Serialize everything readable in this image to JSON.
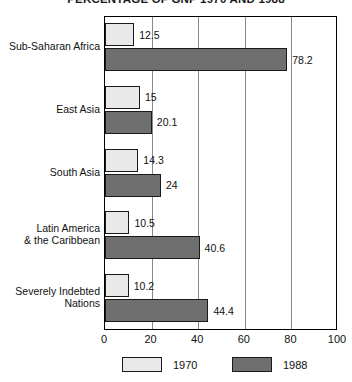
{
  "chart_data": {
    "type": "bar",
    "orientation": "horizontal",
    "title": "PERCENTAGE OF GNP 1970 AND 1988",
    "xlabel": "",
    "ylabel": "",
    "xlim": [
      0,
      100
    ],
    "xticks": [
      "0",
      "20",
      "40",
      "60",
      "80",
      "100"
    ],
    "grid": true,
    "legend_position": "bottom",
    "categories": [
      "Sub-Saharan Africa",
      "East Asia",
      "South Asia",
      "Latin America\n& the Caribbean",
      "Severely Indebted\nNations"
    ],
    "series": [
      {
        "name": "1970",
        "color": "#e9e9e9",
        "values": [
          12.5,
          15,
          14.3,
          10.5,
          10.2
        ]
      },
      {
        "name": "1988",
        "color": "#6f6f6f",
        "values": [
          78.2,
          20.1,
          24,
          40.6,
          44.4
        ]
      }
    ],
    "value_labels": {
      "s1970": [
        "12.5",
        "15",
        "14.3",
        "10.5",
        "10.2"
      ],
      "s1988": [
        "78.2",
        "20.1",
        "24",
        "40.6",
        "44.4"
      ]
    }
  },
  "categories_display": [
    {
      "line1": "Sub-Saharan Africa",
      "line2": ""
    },
    {
      "line1": "East Asia",
      "line2": ""
    },
    {
      "line1": "South Asia",
      "line2": ""
    },
    {
      "line1": "Latin America",
      "line2": "& the Caribbean"
    },
    {
      "line1": "Severely Indebted",
      "line2": "Nations"
    }
  ],
  "legend": {
    "items": [
      {
        "label": "1970",
        "color": "#e9e9e9"
      },
      {
        "label": "1988",
        "color": "#6f6f6f"
      }
    ]
  }
}
